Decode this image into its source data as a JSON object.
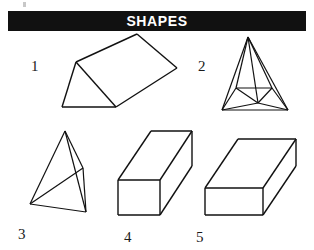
{
  "figure": {
    "width": 314,
    "height": 250,
    "background": "#ffffff",
    "stroke_color": "#111111",
    "artifact_name": "scan-speck"
  },
  "header": {
    "title": "SHAPES",
    "bar_color": "#111111",
    "text_color": "#ffffff"
  },
  "labels": {
    "one": "1",
    "two": "2",
    "three": "3",
    "four": "4",
    "five": "5"
  },
  "shapes": [
    {
      "number": "1",
      "name": "triangular-prism",
      "description": "Triangular prism resting on a horizontal base, tilted up to the right",
      "label_position": {
        "x": 31,
        "y": 58
      },
      "outline": "M 62,107 L 116,107 L 76,62 Z M 76,62 L 137,34 L 177,68 L 116,107 M 137,34 L 177,68",
      "edges": [
        {
          "from": [
            62,
            107
          ],
          "to": [
            116,
            107
          ]
        },
        {
          "from": [
            116,
            107
          ],
          "to": [
            76,
            62
          ]
        },
        {
          "from": [
            76,
            62
          ],
          "to": [
            62,
            107
          ]
        },
        {
          "from": [
            76,
            62
          ],
          "to": [
            137,
            34
          ]
        },
        {
          "from": [
            137,
            34
          ],
          "to": [
            177,
            68
          ]
        },
        {
          "from": [
            177,
            68
          ],
          "to": [
            116,
            107
          ]
        }
      ]
    },
    {
      "number": "2",
      "name": "square-pyramid",
      "description": "Square-based pyramid in wireframe with visible interior edges",
      "label_position": {
        "x": 198,
        "y": 58
      },
      "edges": [
        {
          "from": [
            248,
            37
          ],
          "to": [
            222,
            110
          ]
        },
        {
          "from": [
            248,
            37
          ],
          "to": [
            288,
            110
          ]
        },
        {
          "from": [
            248,
            37
          ],
          "to": [
            236,
            88
          ]
        },
        {
          "from": [
            248,
            37
          ],
          "to": [
            272,
            88
          ]
        },
        {
          "from": [
            248,
            37
          ],
          "to": [
            258,
            103
          ]
        },
        {
          "from": [
            222,
            110
          ],
          "to": [
            288,
            110
          ]
        },
        {
          "from": [
            222,
            110
          ],
          "to": [
            236,
            88
          ]
        },
        {
          "from": [
            236,
            88
          ],
          "to": [
            272,
            88
          ]
        },
        {
          "from": [
            272,
            88
          ],
          "to": [
            288,
            110
          ]
        },
        {
          "from": [
            236,
            88
          ],
          "to": [
            258,
            103
          ]
        },
        {
          "from": [
            272,
            88
          ],
          "to": [
            258,
            103
          ]
        },
        {
          "from": [
            258,
            103
          ],
          "to": [
            222,
            110
          ]
        },
        {
          "from": [
            258,
            103
          ],
          "to": [
            288,
            110
          ]
        }
      ]
    },
    {
      "number": "3",
      "name": "tetrahedron",
      "description": "Tetrahedron with four triangular faces, apex at top",
      "label_position": {
        "x": 18,
        "y": 228
      },
      "edges": [
        {
          "from": [
            65,
            131
          ],
          "to": [
            30,
            204
          ]
        },
        {
          "from": [
            65,
            131
          ],
          "to": [
            86,
            212
          ]
        },
        {
          "from": [
            65,
            131
          ],
          "to": [
            83,
            168
          ]
        },
        {
          "from": [
            30,
            204
          ],
          "to": [
            86,
            212
          ]
        },
        {
          "from": [
            30,
            204
          ],
          "to": [
            83,
            168
          ]
        },
        {
          "from": [
            83,
            168
          ],
          "to": [
            86,
            212
          ]
        }
      ]
    },
    {
      "number": "4",
      "name": "square-beam",
      "description": "Rectangular prism with square cross-section, receding to upper right",
      "label_position": {
        "x": 124,
        "y": 231
      },
      "edges": [
        {
          "from": [
            118,
            180
          ],
          "to": [
            160,
            180
          ]
        },
        {
          "from": [
            160,
            180
          ],
          "to": [
            160,
            215
          ]
        },
        {
          "from": [
            160,
            215
          ],
          "to": [
            118,
            215
          ]
        },
        {
          "from": [
            118,
            215
          ],
          "to": [
            118,
            180
          ]
        },
        {
          "from": [
            118,
            180
          ],
          "to": [
            151,
            131
          ]
        },
        {
          "from": [
            151,
            131
          ],
          "to": [
            192,
            131
          ]
        },
        {
          "from": [
            192,
            131
          ],
          "to": [
            160,
            180
          ]
        },
        {
          "from": [
            192,
            131
          ],
          "to": [
            192,
            166
          ]
        },
        {
          "from": [
            192,
            166
          ],
          "to": [
            160,
            215
          ]
        }
      ]
    },
    {
      "number": "5",
      "name": "rectangular-beam",
      "description": "Wider rectangular prism, receding to upper right",
      "label_position": {
        "x": 196,
        "y": 231
      },
      "edges": [
        {
          "from": [
            205,
            188
          ],
          "to": [
            263,
            188
          ]
        },
        {
          "from": [
            263,
            188
          ],
          "to": [
            263,
            215
          ]
        },
        {
          "from": [
            263,
            215
          ],
          "to": [
            205,
            215
          ]
        },
        {
          "from": [
            205,
            215
          ],
          "to": [
            205,
            188
          ]
        },
        {
          "from": [
            205,
            188
          ],
          "to": [
            238,
            139
          ]
        },
        {
          "from": [
            238,
            139
          ],
          "to": [
            296,
            139
          ]
        },
        {
          "from": [
            296,
            139
          ],
          "to": [
            263,
            188
          ]
        },
        {
          "from": [
            296,
            139
          ],
          "to": [
            296,
            166
          ]
        },
        {
          "from": [
            296,
            166
          ],
          "to": [
            263,
            215
          ]
        }
      ]
    }
  ]
}
